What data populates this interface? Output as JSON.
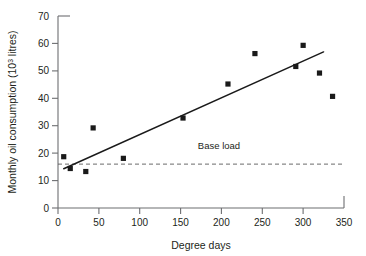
{
  "chart_data": {
    "type": "scatter",
    "title": "",
    "xlabel": "Degree days",
    "ylabel": "Monthly oil consumption (10³ litres)",
    "ylabel_main": "Monthly oil consumption (10",
    "ylabel_sup": "3",
    "ylabel_tail": " litres)",
    "xlim": [
      0,
      350
    ],
    "ylim": [
      0,
      70
    ],
    "xticks": [
      0,
      50,
      100,
      150,
      200,
      250,
      300,
      350
    ],
    "yticks": [
      0,
      10,
      20,
      30,
      40,
      50,
      60,
      70
    ],
    "xtick_labels": [
      "0",
      "50",
      "100",
      "150",
      "200",
      "250",
      "300",
      "350"
    ],
    "ytick_labels": [
      "0",
      "10",
      "20",
      "30",
      "40",
      "50",
      "60",
      "70"
    ],
    "grid": false,
    "legend": "none",
    "marker": "square",
    "marker_color": "#1a1a1a",
    "series": [
      {
        "name": "Monthly oil consumption",
        "x": [
          7,
          15,
          34,
          43,
          80,
          153,
          208,
          241,
          291,
          300,
          320,
          336
        ],
        "y": [
          18.7,
          14.4,
          13.3,
          29.2,
          18.1,
          32.8,
          45.2,
          56.3,
          51.6,
          59.3,
          49.2,
          40.7
        ]
      }
    ],
    "fit_line": {
      "name": "regression line",
      "x": [
        7,
        325
      ],
      "y": [
        14.3,
        56.9
      ],
      "color": "#1a1a1a"
    },
    "annotations": [
      {
        "name": "base-load",
        "label": "Base load",
        "type": "hline",
        "y": 16.0,
        "style": "dashed",
        "color": "#5a5a5a",
        "label_x": 197,
        "label_y": 21.5
      }
    ]
  },
  "axes": {
    "line_color": "#6d6e71",
    "tick_color": "#6d6e71",
    "text_color": "#231f20"
  }
}
